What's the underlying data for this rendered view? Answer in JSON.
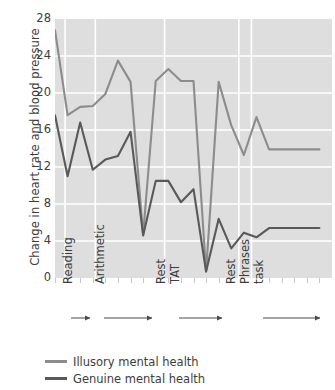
{
  "chart_data": {
    "type": "line",
    "title": "",
    "xlabel": "",
    "ylabel": "Change in heart rate and blood pressure",
    "ylim": [
      0,
      28
    ],
    "yticks": [
      0,
      4,
      8,
      12,
      16,
      20,
      24,
      28
    ],
    "ytick_labels": [
      "0",
      "4",
      "8",
      "12",
      "16",
      "20",
      "24",
      "28"
    ],
    "xlim": [
      0,
      22
    ],
    "grid": true,
    "legend_position": "below-axes-left",
    "stage_labels": [
      "Reading",
      "Arithmetic",
      "Rest",
      "TAT",
      "Rest",
      "Phrases",
      "task"
    ],
    "series": [
      {
        "name": "Illusory mental health",
        "color": "#8c8c8c",
        "x": [
          0,
          1,
          2,
          3,
          4,
          5,
          6,
          7,
          8,
          9,
          10,
          11,
          12,
          13,
          14,
          15,
          16,
          17,
          18,
          19,
          20,
          21
        ],
        "values": [
          26.8,
          17.6,
          18.5,
          18.6,
          19.9,
          23.5,
          21.2,
          4.7,
          21.3,
          22.6,
          21.3,
          21.3,
          0.7,
          21.2,
          16.5,
          13.3,
          17.4,
          13.9,
          13.9,
          13.9,
          13.9,
          13.9
        ]
      },
      {
        "name": "Genuine mental health",
        "color": "#595959",
        "x": [
          0,
          1,
          2,
          3,
          4,
          5,
          6,
          7,
          8,
          9,
          10,
          11,
          12,
          13,
          14,
          15,
          16,
          17,
          18,
          19,
          20,
          21
        ],
        "values": [
          17.6,
          11.0,
          16.8,
          11.7,
          12.8,
          13.2,
          15.8,
          4.6,
          10.5,
          10.5,
          8.2,
          9.6,
          0.7,
          6.4,
          3.2,
          4.9,
          4.4,
          5.4,
          5.4,
          5.4,
          5.4,
          5.4
        ]
      }
    ]
  },
  "legend": {
    "items": [
      {
        "label": "Illusory mental health",
        "color": "#8c8c8c"
      },
      {
        "label": "Genuine mental health",
        "color": "#595959"
      }
    ]
  },
  "axis": {
    "ylabel": "Change in heart rate and blood pressure",
    "ytick_labels": [
      "28",
      "24",
      "20",
      "16",
      "12",
      "8",
      "4",
      "0"
    ]
  },
  "stages": {
    "reading": "Reading",
    "arithmetic": "Arithmetic",
    "rest1": "Rest",
    "tat": "TAT",
    "rest2": "Rest",
    "phrases": "Phrases",
    "task": "task"
  }
}
